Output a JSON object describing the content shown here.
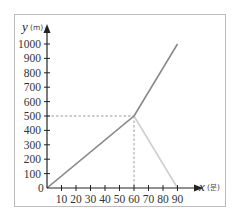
{
  "chart_data": {
    "type": "line",
    "title": "",
    "xlabel": "x",
    "xlabel_unit": "(분)",
    "ylabel": "y",
    "ylabel_unit": "(m)",
    "origin_label": "0",
    "xlim": [
      0,
      95
    ],
    "ylim": [
      0,
      1050
    ],
    "x_ticks": [
      10,
      20,
      30,
      40,
      50,
      60,
      70,
      80,
      90
    ],
    "y_ticks": [
      100,
      200,
      300,
      400,
      500,
      600,
      700,
      800,
      900,
      1000
    ],
    "grid": false,
    "legend": null,
    "series": [
      {
        "name": "dark-line",
        "color": "#8a8a8a",
        "points": [
          [
            0,
            0
          ],
          [
            60,
            500
          ],
          [
            90,
            1000
          ]
        ]
      },
      {
        "name": "light-line",
        "color": "#cfcfcf",
        "points": [
          [
            0,
            0
          ],
          [
            60,
            500
          ],
          [
            90,
            0
          ]
        ]
      }
    ],
    "guides": [
      {
        "type": "dashed",
        "from": [
          0,
          500
        ],
        "to": [
          60,
          500
        ]
      },
      {
        "type": "dashed",
        "from": [
          60,
          500
        ],
        "to": [
          60,
          0
        ]
      }
    ]
  },
  "colors": {
    "frame": "#bdbdbd",
    "axis": "#222222",
    "dark_line": "#8a8a8a",
    "light_line": "#cfcfcf",
    "guide": "#9a9a9a"
  }
}
